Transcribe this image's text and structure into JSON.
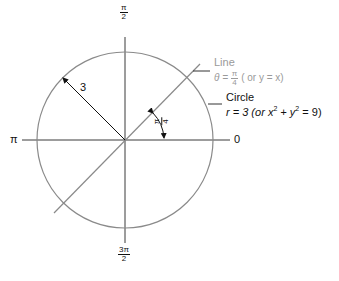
{
  "diagram": {
    "center": {
      "x": 125,
      "y": 140
    },
    "radius_px": 88,
    "colors": {
      "axis": "#3a3a3a",
      "circle": "#8a8a8a",
      "line": "#8a8a8a",
      "text": "#111111",
      "line_label": "#9a9a9a"
    },
    "axis_labels": {
      "top_num": "π",
      "top_den": "2",
      "bottom_num": "3π",
      "bottom_den": "2",
      "left": "π",
      "right": "0"
    },
    "radius_label": "3",
    "angle_label": {
      "num": "π",
      "den": "4"
    },
    "line_annotation": {
      "title": "Line",
      "eq_prefix": "θ = ",
      "frac_num": "π",
      "frac_den": "4",
      "eq_suffix": " ( or y = x)"
    },
    "circle_annotation": {
      "title": "Circle",
      "eq_main": "r = 3 (",
      "eq_or": "or",
      "eq_x": " x",
      "exp1": "2",
      "eq_plus": " + y",
      "exp2": "2",
      "eq_end": " = 9)"
    }
  }
}
